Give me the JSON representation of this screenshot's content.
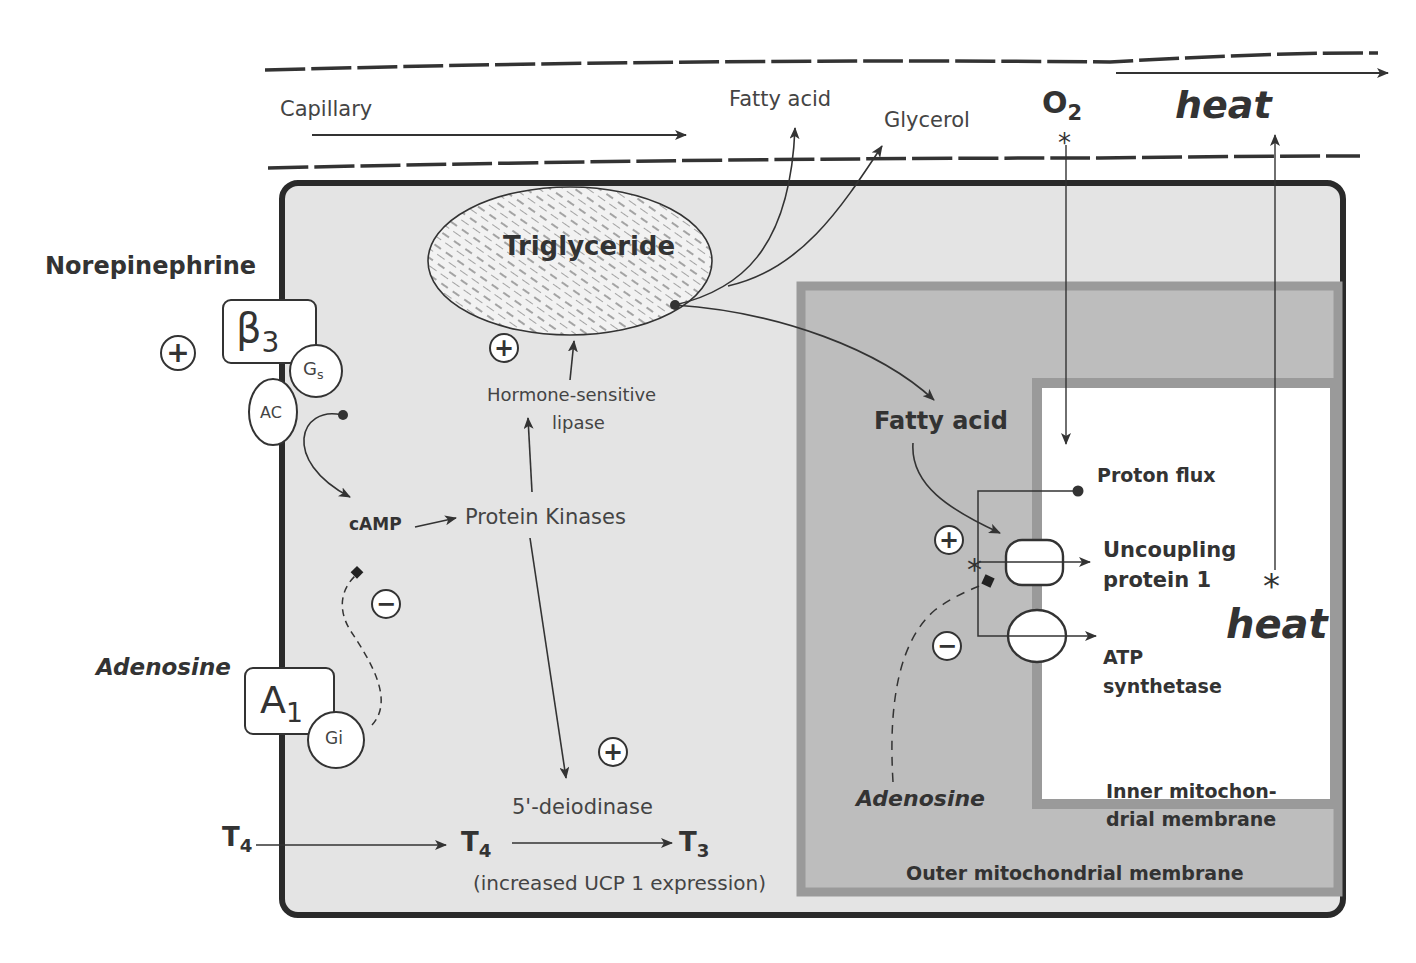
{
  "colors": {
    "cell_fill": "#e4e4e4",
    "cell_border": "#2a2a2a",
    "outer_mito_fill": "#bdbdbd",
    "outer_mito_border": "#9a9a9a",
    "inner_mito_fill": "#ffffff",
    "inner_mito_border": "#9a9a9a",
    "line": "#333333",
    "text": "#333333"
  },
  "capillary": {
    "label": "Capillary",
    "products": [
      "Fatty acid",
      "Glycerol"
    ],
    "oxygen": {
      "symbol": "O",
      "subscript": "2"
    },
    "heat_out": "heat"
  },
  "receptors": {
    "norepinephrine": {
      "ligand": "Norepinephrine",
      "sign": "+",
      "receptor": {
        "symbol": "β",
        "subscript": "3"
      },
      "g_protein": {
        "symbol": "G",
        "subscript": "s"
      },
      "effector": "AC"
    },
    "adenosine": {
      "ligand": "Adenosine",
      "sign": "−",
      "receptor": {
        "symbol": "A",
        "subscript": "1"
      },
      "g_protein": "Gi"
    }
  },
  "cytoplasm": {
    "triglyceride": "Triglyceride",
    "lipase_sign": "+",
    "lipase_line1": "Hormone-sensitive",
    "lipase_line2": "lipase",
    "camp": "cAMP",
    "protein_kinases": "Protein Kinases",
    "deiodinase_sign": "+",
    "deiodinase": "5'-deiodinase",
    "t4_outside": {
      "symbol": "T",
      "subscript": "4"
    },
    "t4_inside": {
      "symbol": "T",
      "subscript": "4"
    },
    "t3": {
      "symbol": "T",
      "subscript": "3"
    },
    "ucp_note": "(increased UCP 1 expression)"
  },
  "mitochondrion": {
    "fatty_acid": "Fatty acid",
    "plus_sign": "+",
    "minus_sign": "−",
    "adenosine": "Adenosine",
    "proton_flux": "Proton flux",
    "ucp_line1": "Uncoupling",
    "ucp_line2": "protein 1",
    "atp_line1": "ATP",
    "atp_line2": "synthetase",
    "heat": "heat",
    "inner_membrane_line1": "Inner mitochon-",
    "inner_membrane_line2": "drial membrane",
    "outer_membrane": "Outer mitochondrial membrane"
  }
}
